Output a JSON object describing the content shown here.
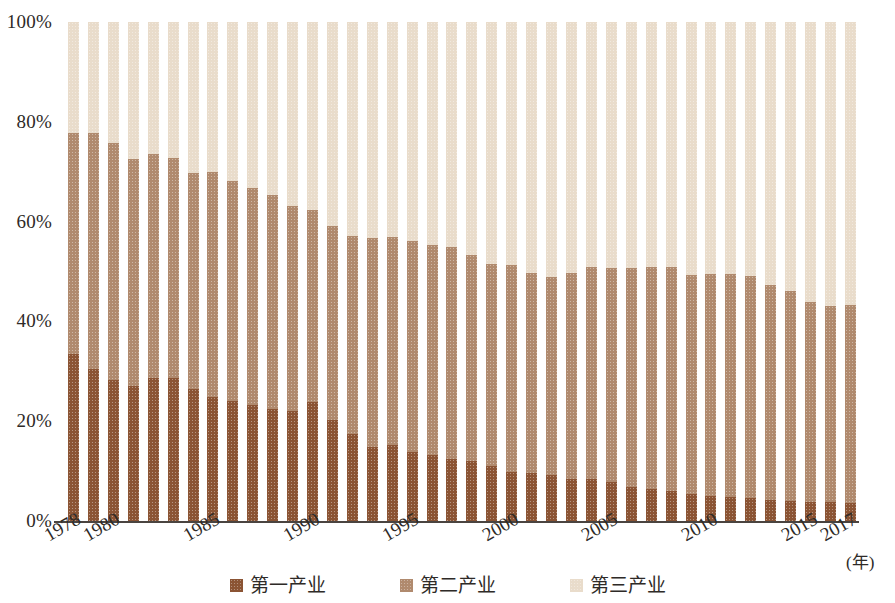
{
  "chart_data": {
    "type": "bar",
    "subtype": "stacked-100-percent",
    "title": "",
    "xlabel": "(年)",
    "ylabel": "",
    "ylim": [
      0,
      100
    ],
    "y_ticks": [
      "0%",
      "20%",
      "40%",
      "60%",
      "80%",
      "100%"
    ],
    "y_tick_values": [
      0,
      20,
      40,
      60,
      80,
      100
    ],
    "x_tick_labels": [
      "1978",
      "1980",
      "1985",
      "1990",
      "1995",
      "2000",
      "2005",
      "2010",
      "2015",
      "2017"
    ],
    "x_tick_years": [
      1978,
      1980,
      1985,
      1990,
      1995,
      2000,
      2005,
      2010,
      2015,
      2017
    ],
    "grid": false,
    "legend_position": "bottom",
    "categories": [
      "1978",
      "1979",
      "1980",
      "1981",
      "1982",
      "1983",
      "1984",
      "1985",
      "1986",
      "1987",
      "1988",
      "1989",
      "1990",
      "1991",
      "1992",
      "1993",
      "1994",
      "1995",
      "1996",
      "1997",
      "1998",
      "1999",
      "2000",
      "2001",
      "2002",
      "2003",
      "2004",
      "2005",
      "2006",
      "2007",
      "2008",
      "2009",
      "2010",
      "2011",
      "2012",
      "2013",
      "2014",
      "2015",
      "2016",
      "2017"
    ],
    "series": [
      {
        "name": "第一产业",
        "color": "#8b5434",
        "values": [
          33.4,
          30.5,
          28.2,
          27.0,
          28.7,
          28.6,
          26.5,
          24.9,
          24.0,
          23.2,
          22.4,
          22.0,
          23.9,
          20.2,
          17.4,
          14.9,
          15.2,
          13.8,
          13.2,
          12.4,
          12.0,
          11.0,
          9.9,
          9.7,
          9.3,
          8.4,
          8.5,
          7.8,
          6.9,
          6.4,
          6.1,
          5.5,
          5.0,
          4.9,
          4.6,
          4.2,
          4.0,
          3.9,
          3.8,
          3.7
        ]
      },
      {
        "name": "第二产业",
        "color": "#b08a6e",
        "values": [
          44.4,
          47.3,
          47.6,
          45.6,
          44.8,
          44.1,
          43.2,
          45.0,
          44.1,
          43.5,
          43.0,
          41.1,
          38.5,
          39.0,
          39.7,
          41.8,
          41.7,
          42.3,
          42.2,
          42.5,
          41.3,
          40.6,
          41.4,
          40.0,
          39.7,
          41.3,
          42.4,
          43.0,
          43.9,
          44.6,
          44.8,
          43.8,
          44.6,
          44.6,
          44.6,
          43.1,
          42.1,
          40.0,
          39.2,
          39.6
        ]
      },
      {
        "name": "第三产业",
        "color": "#e9dccb",
        "values": [
          22.2,
          22.2,
          24.2,
          27.4,
          26.5,
          27.3,
          30.3,
          30.1,
          31.9,
          33.3,
          34.6,
          36.9,
          37.6,
          40.8,
          42.9,
          43.3,
          43.1,
          43.9,
          44.6,
          45.1,
          46.7,
          48.4,
          48.7,
          50.3,
          51.0,
          50.3,
          49.1,
          49.2,
          49.2,
          49.0,
          49.1,
          50.7,
          50.4,
          50.5,
          50.8,
          52.7,
          53.9,
          56.1,
          57.0,
          56.7
        ]
      }
    ],
    "legend": [
      {
        "label": "第一产业",
        "color": "#8b5434"
      },
      {
        "label": "第二产业",
        "color": "#b08a6e"
      },
      {
        "label": "第三产业",
        "color": "#e9dccb"
      }
    ]
  }
}
